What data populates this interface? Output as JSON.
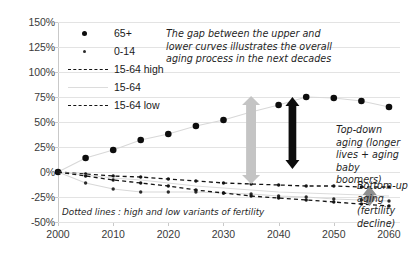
{
  "chart_data": {
    "type": "line",
    "title": "",
    "xlabel": "",
    "ylabel": "",
    "x": [
      2000,
      2005,
      2010,
      2015,
      2020,
      2025,
      2030,
      2035,
      2040,
      2045,
      2050,
      2055,
      2060
    ],
    "xlim": [
      2000,
      2062
    ],
    "ylim": [
      -50,
      150
    ],
    "ytick_labels": [
      "150%",
      "125%",
      "100%",
      "75%",
      "50%",
      "25%",
      "0%",
      "-25%",
      "-50%"
    ],
    "ytick_values": [
      150,
      125,
      100,
      75,
      50,
      25,
      0,
      -25,
      -50
    ],
    "xtick_labels": [
      "2000",
      "2010",
      "2020",
      "2030",
      "2040",
      "2050",
      "2060"
    ],
    "xtick_values": [
      2000,
      2010,
      2020,
      2030,
      2040,
      2050,
      2060
    ],
    "grid": true,
    "legend_position": "top-left",
    "series": [
      {
        "name": "65+",
        "marker": "dot",
        "style": "solid-light",
        "color": "#0d0d0d",
        "values": [
          0,
          14,
          22,
          32,
          38,
          46,
          52,
          60,
          67,
          75,
          74,
          71,
          65
        ]
      },
      {
        "name": "0-14",
        "marker": "small-dot",
        "style": "solid-light",
        "color": "#2b2b2b",
        "values": [
          0,
          -11,
          -17,
          -20,
          -20,
          -20,
          -21,
          -22,
          -24,
          -25,
          -27,
          -28,
          -29
        ]
      },
      {
        "name": "15-64 high",
        "marker": "small-dot",
        "style": "dashed",
        "color": "#141414",
        "values": [
          0,
          -2,
          -4,
          -5,
          -7,
          -9,
          -11,
          -12,
          -13,
          -14,
          -14,
          -15,
          -15
        ]
      },
      {
        "name": "15-64",
        "marker": "none",
        "style": "solid-light",
        "color": "#dcdcdc",
        "values": [
          0,
          -3,
          -6,
          -8,
          -11,
          -14,
          -16,
          -18,
          -20,
          -21,
          -22,
          -23,
          -24
        ]
      },
      {
        "name": "15-64 low",
        "marker": "small-dot",
        "style": "dashed",
        "color": "#141414",
        "values": [
          0,
          -4,
          -8,
          -11,
          -14,
          -18,
          -21,
          -24,
          -26,
          -28,
          -30,
          -32,
          -34
        ]
      }
    ]
  },
  "legend": {
    "items": [
      {
        "label": "65+",
        "key": "dot"
      },
      {
        "label": "0-14",
        "key": "small-dot"
      },
      {
        "label": "15-64 high",
        "key": "dash"
      },
      {
        "label": "15-64",
        "key": "solid"
      },
      {
        "label": "15-64 low",
        "key": "dash"
      }
    ]
  },
  "annotations": {
    "main_note": "The gap between the upper and lower curves illustrates the overall aging process in the next decades",
    "top_down": "Top-down aging (longer lives + aging baby boomers)",
    "bottom_up": "Bottom-up aging (fertility decline)",
    "dotted_note": "Dotted lines : high and low variants of fertility",
    "arrows": [
      {
        "name": "gap-arrow",
        "color": "#c4c4c4",
        "from": 76,
        "to": -12
      },
      {
        "name": "top-down-arrow",
        "color": "#0d0d0d",
        "from": 75,
        "to": 3
      },
      {
        "name": "bottom-up-arrow",
        "color": "#8f8f8f",
        "from": -14,
        "to": -34
      }
    ]
  }
}
